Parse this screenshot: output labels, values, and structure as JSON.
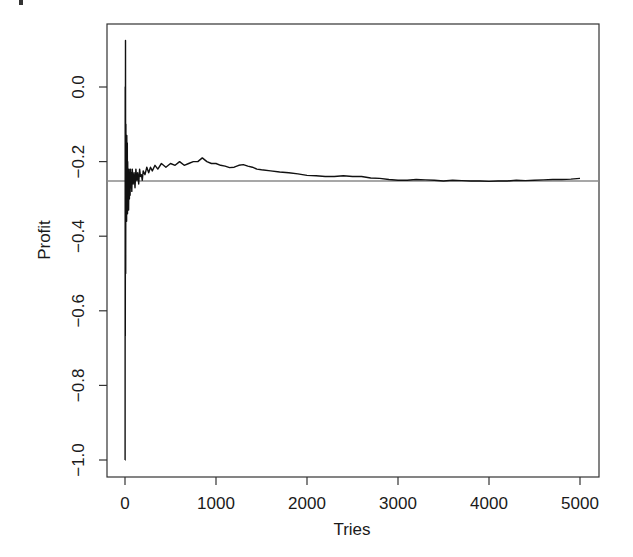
{
  "chart_data": {
    "type": "line",
    "title": "",
    "xlabel": "Tries",
    "ylabel": "Profit",
    "xlim": [
      -200,
      5200
    ],
    "ylim": [
      -1.05,
      0.17
    ],
    "grid": false,
    "legend": null,
    "x_ticks": [
      0,
      1000,
      2000,
      3000,
      4000,
      5000
    ],
    "x_tick_labels": [
      "0",
      "1000",
      "2000",
      "3000",
      "4000",
      "5000"
    ],
    "y_ticks": [
      0.0,
      -0.2,
      -0.4,
      -0.6,
      -0.8,
      -1.0
    ],
    "y_tick_labels": [
      "0.0",
      "−0.2",
      "−0.4",
      "−0.6",
      "−0.8",
      "−1.0"
    ],
    "reference_line": {
      "orientation": "horizontal",
      "y": -0.252,
      "color": "#8a8a8a"
    },
    "series": [
      {
        "name": "Profit",
        "color": "#111111",
        "x": [
          1,
          2,
          3,
          5,
          8,
          10,
          12,
          15,
          18,
          20,
          22,
          25,
          28,
          30,
          33,
          36,
          40,
          44,
          48,
          52,
          56,
          60,
          65,
          70,
          75,
          80,
          90,
          100,
          110,
          120,
          130,
          140,
          150,
          160,
          170,
          180,
          190,
          200,
          220,
          240,
          260,
          280,
          300,
          330,
          360,
          400,
          450,
          500,
          550,
          600,
          650,
          700,
          750,
          800,
          850,
          900,
          950,
          1000,
          1050,
          1100,
          1150,
          1200,
          1250,
          1300,
          1350,
          1400,
          1450,
          1500,
          1600,
          1700,
          1800,
          1900,
          2000,
          2100,
          2200,
          2300,
          2400,
          2500,
          2600,
          2700,
          2800,
          2900,
          3000,
          3100,
          3200,
          3300,
          3400,
          3500,
          3600,
          3700,
          3800,
          3900,
          4000,
          4100,
          4200,
          4300,
          4400,
          4500,
          4600,
          4700,
          4800,
          4900,
          5000
        ],
        "values": [
          -1.0,
          0.0,
          -0.667,
          0.125,
          -0.5,
          -0.1,
          -0.33,
          -0.2,
          -0.36,
          -0.13,
          -0.3,
          -0.15,
          -0.34,
          -0.2,
          -0.3,
          -0.23,
          -0.33,
          -0.22,
          -0.3,
          -0.24,
          -0.29,
          -0.22,
          -0.27,
          -0.23,
          -0.28,
          -0.22,
          -0.26,
          -0.23,
          -0.27,
          -0.22,
          -0.25,
          -0.23,
          -0.26,
          -0.22,
          -0.24,
          -0.235,
          -0.25,
          -0.225,
          -0.235,
          -0.215,
          -0.23,
          -0.215,
          -0.225,
          -0.21,
          -0.22,
          -0.205,
          -0.215,
          -0.205,
          -0.21,
          -0.2,
          -0.21,
          -0.205,
          -0.2,
          -0.2,
          -0.19,
          -0.2,
          -0.205,
          -0.205,
          -0.21,
          -0.212,
          -0.216,
          -0.215,
          -0.21,
          -0.208,
          -0.212,
          -0.215,
          -0.22,
          -0.222,
          -0.225,
          -0.228,
          -0.23,
          -0.233,
          -0.237,
          -0.238,
          -0.24,
          -0.24,
          -0.238,
          -0.24,
          -0.24,
          -0.244,
          -0.245,
          -0.248,
          -0.25,
          -0.25,
          -0.248,
          -0.249,
          -0.25,
          -0.252,
          -0.25,
          -0.251,
          -0.252,
          -0.252,
          -0.253,
          -0.252,
          -0.252,
          -0.25,
          -0.251,
          -0.25,
          -0.249,
          -0.248,
          -0.248,
          -0.247,
          -0.245
        ]
      }
    ]
  },
  "axes": {
    "x_title": "Tries",
    "y_title": "Profit"
  }
}
